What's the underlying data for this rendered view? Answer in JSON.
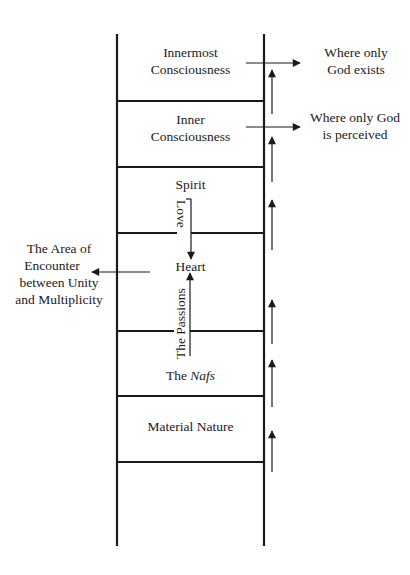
{
  "diagram": {
    "type": "ladder",
    "colors": {
      "ink": "#1a1a1a",
      "background": "#ffffff"
    },
    "levels": [
      {
        "id": "innermost-consciousness",
        "line1": "Innermost",
        "line2": "Consciousness"
      },
      {
        "id": "inner-consciousness",
        "line1": "Inner",
        "line2": "Consciousness"
      },
      {
        "id": "spirit",
        "label": "Spirit"
      },
      {
        "id": "heart",
        "label": "Heart"
      },
      {
        "id": "nafs",
        "prefix": "The ",
        "italic": "Nafs"
      },
      {
        "id": "material-nature",
        "label": "Material Nature"
      }
    ],
    "vertical_arrows": {
      "love": "Love",
      "passions": "The Passions"
    },
    "side_annotations": {
      "god_exists": {
        "line1": "Where only",
        "line2": "God exists"
      },
      "god_perceived": {
        "line1": "Where only God",
        "line2": "is perceived"
      },
      "encounter": {
        "line1": "The Area of",
        "line2": "Encounter",
        "line3": "between Unity",
        "line4": "and Multiplicity"
      }
    },
    "ascending_arrow_count": 7
  }
}
